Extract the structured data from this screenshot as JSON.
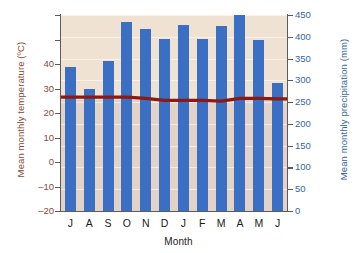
{
  "chart_data": {
    "type": "bar",
    "title": "",
    "subtitle": "",
    "xlabel": "Month",
    "ylabel": "Mean monthly temperature (ºC)",
    "y2label": "Mean monthly precipitation (mm)",
    "categories": [
      "J",
      "A",
      "S",
      "O",
      "N",
      "D",
      "J",
      "F",
      "M",
      "A",
      "M",
      "J"
    ],
    "series": [
      {
        "name": "Mean monthly precipitation (mm)",
        "type": "bar",
        "axis": "right",
        "unit": "mm",
        "color": "#3b6fc4",
        "values": [
          330,
          280,
          345,
          435,
          418,
          395,
          428,
          395,
          425,
          450,
          392,
          295
        ]
      },
      {
        "name": "Mean monthly temperature (ºC)",
        "type": "line",
        "axis": "left",
        "unit": "ºC",
        "color": "#8b1a13",
        "values": [
          26.5,
          26.5,
          26.5,
          26.5,
          26,
          25.2,
          25.2,
          25.2,
          24.8,
          26,
          26,
          25.8
        ]
      }
    ],
    "left_axis": {
      "label": "Mean monthly temperature (ºC)",
      "ticks": [
        "",
        "",
        "40",
        "30",
        "20",
        "10",
        "0",
        "–10",
        "–20"
      ],
      "tick_values": [
        60,
        50,
        40,
        30,
        20,
        10,
        0,
        -10,
        -20
      ],
      "min": -20,
      "max": 60,
      "step": 10,
      "color": "#8a4a32"
    },
    "right_axis": {
      "label": "Mean monthly precipitation (mm)",
      "ticks": [
        "450",
        "400",
        "350",
        "300",
        "250",
        "200",
        "150",
        "100",
        "50",
        "0"
      ],
      "tick_values": [
        450,
        400,
        350,
        300,
        250,
        200,
        150,
        100,
        50,
        0
      ],
      "min": 0,
      "max": 450,
      "step": 50,
      "color": "#3465a4"
    },
    "grid": true,
    "legend": "none",
    "plot_background_upper": "#efe2d2",
    "plot_background_lower": "#e3d3c6"
  }
}
